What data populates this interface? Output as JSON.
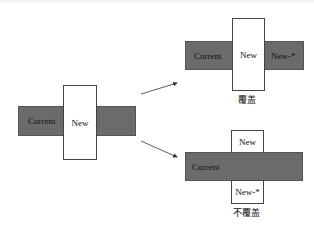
{
  "diagram": {
    "left": {
      "current": "Current",
      "new": "New"
    },
    "overwrite": {
      "current": "Current",
      "new": "New",
      "new_star": "New-*",
      "caption": "覆盖"
    },
    "no_overwrite": {
      "current": "Current",
      "new": "New",
      "new_star": "New-*",
      "caption": "不覆盖"
    }
  },
  "colors": {
    "bar": "#6b6b6b",
    "box_border": "#444444",
    "arrow": "#333333"
  }
}
